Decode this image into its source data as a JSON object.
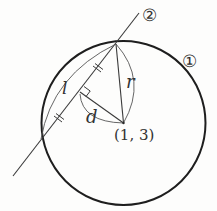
{
  "diagram": {
    "labels": {
      "circle_marker": "①",
      "line_marker": "②",
      "chord_length": "l",
      "distance": "d",
      "radius": "r",
      "center": "(1, 3)"
    },
    "colors": {
      "stroke": "#2a2a2a",
      "background": "#fdfdfc"
    }
  }
}
